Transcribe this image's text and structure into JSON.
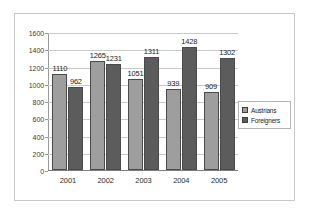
{
  "chart_data": {
    "type": "bar",
    "title": "",
    "xlabel": "",
    "ylabel": "",
    "categories": [
      "2001",
      "2002",
      "2003",
      "2004",
      "2005"
    ],
    "series": [
      {
        "name": "Austrians",
        "color": "#9e9e9e",
        "values": [
          1110,
          1265,
          1051,
          939,
          909
        ]
      },
      {
        "name": "Foreigners",
        "color": "#5c5c5c",
        "values": [
          962,
          1231,
          1311,
          1428,
          1302
        ]
      }
    ],
    "ylim": [
      0,
      1600
    ],
    "ytick_values": [
      0,
      200,
      400,
      600,
      800,
      1000,
      1200,
      1400,
      1600
    ],
    "ytick_labels": [
      "0",
      "200",
      "400",
      "600",
      "800",
      "1000",
      "1200",
      "1400",
      "1600"
    ],
    "grid": true,
    "data_labels": true,
    "legend_position": "right"
  }
}
